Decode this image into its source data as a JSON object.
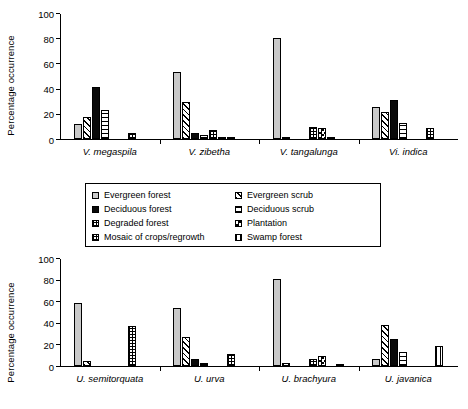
{
  "figure": {
    "title": "",
    "ylabel": "Percentage occurrence"
  },
  "legend": {
    "items": [
      {
        "label": "Evergreen forest",
        "key": "evergreen-forest",
        "pattern": "solid-light-gray"
      },
      {
        "label": "Evergreen scrub",
        "key": "evergreen-scrub",
        "pattern": "diagonal-hatch"
      },
      {
        "label": "Deciduous forest",
        "key": "deciduous-forest",
        "pattern": "solid-black"
      },
      {
        "label": "Deciduous scrub",
        "key": "deciduous-scrub",
        "pattern": "horizontal-hatch"
      },
      {
        "label": "Degraded forest",
        "key": "degraded-forest",
        "pattern": "fine-grid"
      },
      {
        "label": "Plantation",
        "key": "plantation",
        "pattern": "checkerboard"
      },
      {
        "label": "Mosaic of crops/regrowth",
        "key": "mosaic",
        "pattern": "fine-grid"
      },
      {
        "label": "Swamp forest",
        "key": "swamp-forest",
        "pattern": "vertical-hatch"
      }
    ]
  },
  "chart_data": [
    {
      "id": "top",
      "type": "bar",
      "title": "",
      "xlabel": "",
      "ylabel": "Percentage occurrence",
      "ylim": [
        0,
        100
      ],
      "yticks": [
        0,
        20,
        40,
        60,
        80,
        100
      ],
      "grid": false,
      "legend_position": "below",
      "categories": [
        "V. megaspila",
        "V. zibetha",
        "V. tangalunga",
        "Vi. indica"
      ],
      "series": [
        {
          "name": "Evergreen forest",
          "pattern": "evergreen-forest",
          "values": [
            12,
            54,
            80.5,
            26
          ]
        },
        {
          "name": "Evergreen scrub",
          "pattern": "evergreen-scrub",
          "values": [
            18,
            30,
            1,
            22
          ]
        },
        {
          "name": "Deciduous forest",
          "pattern": "deciduous-forest",
          "values": [
            41.5,
            4.5,
            0,
            31
          ]
        },
        {
          "name": "Deciduous scrub",
          "pattern": "deciduous-scrub",
          "values": [
            23,
            3,
            0,
            13
          ]
        },
        {
          "name": "Degraded forest",
          "pattern": "degraded-forest",
          "values": [
            0,
            7.5,
            10,
            0
          ]
        },
        {
          "name": "Plantation",
          "pattern": "plantation",
          "values": [
            0,
            0.5,
            9,
            0
          ]
        },
        {
          "name": "Mosaic of crops/regrowth",
          "pattern": "mosaic",
          "values": [
            5,
            2,
            0.5,
            9
          ]
        },
        {
          "name": "Swamp forest",
          "pattern": "swamp-forest",
          "values": [
            0,
            0,
            0,
            0
          ]
        }
      ]
    },
    {
      "id": "bottom",
      "type": "bar",
      "title": "",
      "xlabel": "",
      "ylabel": "Percentage occurrence",
      "ylim": [
        0,
        100
      ],
      "yticks": [
        0,
        20,
        40,
        60,
        80,
        100
      ],
      "grid": false,
      "legend_position": "above",
      "categories": [
        "U. semitorquata",
        "U. urva",
        "U. brachyura",
        "U. javanica"
      ],
      "series": [
        {
          "name": "Evergreen forest",
          "pattern": "evergreen-forest",
          "values": [
            59,
            54,
            81.5,
            7
          ]
        },
        {
          "name": "Evergreen scrub",
          "pattern": "evergreen-scrub",
          "values": [
            5,
            27,
            3,
            38
          ]
        },
        {
          "name": "Deciduous forest",
          "pattern": "deciduous-forest",
          "values": [
            0,
            7,
            0,
            25
          ]
        },
        {
          "name": "Deciduous scrub",
          "pattern": "deciduous-scrub",
          "values": [
            0,
            2.5,
            0,
            13
          ]
        },
        {
          "name": "Degraded forest",
          "pattern": "degraded-forest",
          "values": [
            0,
            0,
            7,
            0
          ]
        },
        {
          "name": "Plantation",
          "pattern": "plantation",
          "values": [
            0,
            0,
            9,
            0
          ]
        },
        {
          "name": "Mosaic of crops/regrowth",
          "pattern": "mosaic",
          "values": [
            37,
            11,
            0,
            0
          ]
        },
        {
          "name": "Swamp forest",
          "pattern": "swamp-forest",
          "values": [
            0,
            0,
            1.5,
            19
          ]
        }
      ]
    }
  ]
}
